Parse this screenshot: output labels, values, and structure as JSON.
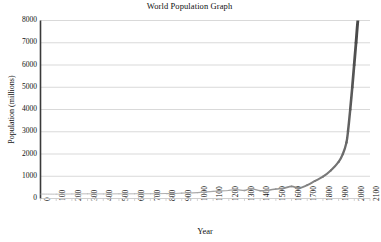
{
  "chart_data": {
    "type": "line",
    "title": "World Population Graph",
    "xlabel": "Year",
    "ylabel": "Population (millions)",
    "xlim": [
      0,
      2100
    ],
    "ylim": [
      0,
      8000
    ],
    "xticks": [
      0,
      100,
      200,
      300,
      400,
      500,
      600,
      700,
      800,
      900,
      1000,
      1100,
      1200,
      1300,
      1400,
      1500,
      1600,
      1700,
      1800,
      1900,
      2000,
      2100
    ],
    "yticks": [
      0,
      1000,
      2000,
      3000,
      4000,
      5000,
      6000,
      7000,
      8000
    ],
    "grid": "horizontal",
    "legend": "none",
    "series": [
      {
        "name": "World population",
        "color": "#555555",
        "x": [
          0,
          100,
          200,
          300,
          400,
          500,
          600,
          700,
          800,
          900,
          1000,
          1100,
          1200,
          1250,
          1300,
          1340,
          1400,
          1450,
          1500,
          1550,
          1600,
          1650,
          1700,
          1750,
          1800,
          1850,
          1900,
          1927,
          1950,
          1960,
          1974,
          1987,
          1999,
          2011,
          2024,
          2050
        ],
        "values": [
          200,
          195,
          205,
          210,
          205,
          210,
          210,
          215,
          220,
          240,
          265,
          320,
          360,
          400,
          360,
          443,
          350,
          374,
          425,
          460,
          545,
          470,
          600,
          790,
          980,
          1260,
          1650,
          2000,
          2520,
          3030,
          4000,
          5000,
          6000,
          7000,
          8100,
          9700
        ]
      }
    ]
  },
  "axis": {
    "y_tick_labels": [
      "0",
      "1000",
      "2000",
      "3000",
      "4000",
      "5000",
      "6000",
      "7000",
      "8000"
    ],
    "x_tick_labels": [
      "0",
      "100",
      "200",
      "300",
      "400",
      "500",
      "600",
      "700",
      "800",
      "900",
      "1000",
      "1100",
      "1200",
      "1300",
      "1400",
      "1500",
      "1600",
      "1700",
      "1800",
      "1900",
      "2000",
      "2100"
    ]
  },
  "colors": {
    "axis": "#3a3a3a",
    "grid": "#c9c9c9",
    "line_early": "#b8b8b8",
    "line_late": "#4a4a4a",
    "text": "#111111",
    "background": "#ffffff"
  }
}
